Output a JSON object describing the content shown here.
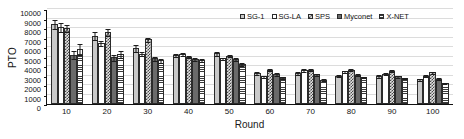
{
  "chart_data": {
    "type": "bar",
    "title": "",
    "xlabel": "Round",
    "ylabel": "PTO",
    "ylim": [
      0,
      10000
    ],
    "ytick_step": 1000,
    "yticks": [
      "0",
      "1000",
      "2000",
      "3000",
      "4000",
      "5000",
      "6000",
      "7000",
      "8000",
      "9000",
      "10000"
    ],
    "grid": true,
    "legend_position": "top-right",
    "categories": [
      "10",
      "20",
      "30",
      "40",
      "50",
      "60",
      "70",
      "80",
      "90",
      "100"
    ],
    "series": [
      {
        "name": "SG-1",
        "fill": "solid-light-gray",
        "values": [
          8400,
          7200,
          5900,
          5150,
          5350,
          3300,
          3250,
          3000,
          2950,
          2600
        ],
        "errors": [
          500,
          450,
          400,
          250,
          250,
          200,
          200,
          180,
          170,
          160
        ]
      },
      {
        "name": "SG-LA",
        "fill": "white",
        "values": [
          8100,
          6400,
          5300,
          5300,
          4800,
          2900,
          3550,
          3450,
          3200,
          2950
        ],
        "errors": [
          500,
          300,
          250,
          220,
          200,
          180,
          200,
          180,
          170,
          160
        ]
      },
      {
        "name": "SPS",
        "fill": "checkerboard",
        "values": [
          8000,
          7550,
          6800,
          5000,
          5100,
          3600,
          3600,
          3600,
          3500,
          3350
        ],
        "errors": [
          450,
          400,
          250,
          200,
          200,
          180,
          170,
          160,
          150,
          150
        ]
      },
      {
        "name": "Myconet",
        "fill": "dark-dotted",
        "values": [
          5200,
          4900,
          4800,
          4700,
          4700,
          3150,
          3150,
          3100,
          2900,
          2650
        ],
        "errors": [
          500,
          400,
          250,
          220,
          200,
          170,
          160,
          160,
          150,
          140
        ]
      },
      {
        "name": "X-NET",
        "fill": "horizontal-lines",
        "values": [
          5800,
          5250,
          4600,
          4650,
          4200,
          2800,
          2550,
          2850,
          2750,
          2200
        ],
        "errors": [
          600,
          400,
          250,
          200,
          180,
          160,
          150,
          150,
          140,
          130
        ]
      }
    ]
  },
  "legend": {
    "items": [
      {
        "label": "SG-1"
      },
      {
        "label": "SG-LA"
      },
      {
        "label": "SPS"
      },
      {
        "label": "Myconet"
      },
      {
        "label": "X-NET"
      }
    ]
  }
}
